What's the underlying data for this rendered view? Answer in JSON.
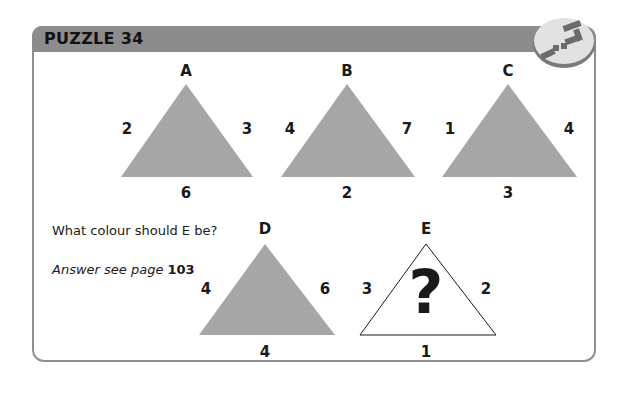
{
  "header": {
    "title": "PUZZLE 34",
    "icon": "puzzle-blocks-icon"
  },
  "question": "What colour should E be?",
  "answer": {
    "prefix": "Answer see page",
    "page": "103"
  },
  "colors": {
    "header": "#8c8c8c",
    "triangle_fill": "#a6a6a6",
    "border": "#8f8f8f"
  },
  "triangles": [
    {
      "name": "A",
      "left": "2",
      "right": "3",
      "bottom": "6",
      "fill": "grey"
    },
    {
      "name": "B",
      "left": "4",
      "right": "7",
      "bottom": "2",
      "fill": "grey"
    },
    {
      "name": "C",
      "left": "1",
      "right": "4",
      "bottom": "3",
      "fill": "grey"
    },
    {
      "name": "D",
      "left": "4",
      "right": "6",
      "bottom": "4",
      "fill": "grey"
    },
    {
      "name": "E",
      "left": "3",
      "right": "2",
      "bottom": "1",
      "fill": "unknown",
      "symbol": "?"
    }
  ]
}
